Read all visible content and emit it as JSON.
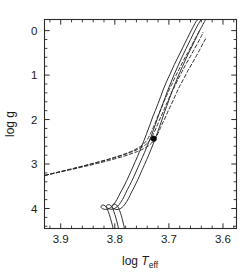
{
  "chart_data": {
    "type": "line",
    "title": "",
    "xlabel": "log T_eff",
    "ylabel": "log g",
    "xlabel_parts": {
      "prefix": "log ",
      "symbol": "T",
      "subscript": "eff"
    },
    "xlim": [
      3.93,
      3.575
    ],
    "ylim": [
      4.45,
      -0.25
    ],
    "x_inverted": true,
    "y_inverted": true,
    "grid": false,
    "legend": "none",
    "xticks": [
      3.9,
      3.8,
      3.7,
      3.6
    ],
    "xtick_labels": [
      "3.9",
      "3.8",
      "3.7",
      "3.6"
    ],
    "x_minor_ticks": [
      3.92,
      3.88,
      3.86,
      3.84,
      3.82,
      3.78,
      3.76,
      3.74,
      3.72,
      3.68,
      3.66,
      3.64,
      3.62,
      3.58
    ],
    "yticks": [
      0,
      1,
      2,
      3,
      4
    ],
    "ytick_labels": [
      "0",
      "1",
      "2",
      "3",
      "4"
    ],
    "y_minor_ticks": [
      0.2,
      0.4,
      0.6,
      0.8,
      1.2,
      1.4,
      1.6,
      1.8,
      2.2,
      2.4,
      2.6,
      2.8,
      3.2,
      3.4,
      3.6,
      3.8,
      4.2,
      4.4
    ],
    "series": [
      {
        "name": "isochrone-solid-1",
        "style": "solid",
        "color": "#262626",
        "points": [
          [
            3.782,
            4.47
          ],
          [
            3.783,
            4.4
          ],
          [
            3.785,
            4.3
          ],
          [
            3.787,
            4.2
          ],
          [
            3.789,
            4.12
          ],
          [
            3.791,
            4.05
          ],
          [
            3.793,
            3.99
          ],
          [
            3.795,
            3.95
          ],
          [
            3.797,
            3.92
          ],
          [
            3.799,
            3.905
          ],
          [
            3.801,
            3.9
          ],
          [
            3.803,
            3.905
          ],
          [
            3.804,
            3.915
          ],
          [
            3.805,
            3.935
          ],
          [
            3.805,
            3.96
          ],
          [
            3.804,
            3.985
          ],
          [
            3.802,
            4.005
          ],
          [
            3.799,
            4.02
          ],
          [
            3.796,
            4.025
          ],
          [
            3.793,
            4.02
          ],
          [
            3.79,
            4.005
          ],
          [
            3.787,
            3.98
          ],
          [
            3.784,
            3.945
          ],
          [
            3.781,
            3.9
          ],
          [
            3.778,
            3.845
          ],
          [
            3.775,
            3.78
          ],
          [
            3.772,
            3.71
          ],
          [
            3.769,
            3.63
          ],
          [
            3.765,
            3.54
          ],
          [
            3.761,
            3.44
          ],
          [
            3.757,
            3.34
          ],
          [
            3.753,
            3.23
          ],
          [
            3.749,
            3.12
          ],
          [
            3.745,
            3.01
          ],
          [
            3.741,
            2.9
          ],
          [
            3.737,
            2.79
          ],
          [
            3.733,
            2.67
          ],
          [
            3.729,
            2.55
          ],
          [
            3.725,
            2.42
          ],
          [
            3.721,
            2.29
          ],
          [
            3.717,
            2.15
          ],
          [
            3.713,
            2.01
          ],
          [
            3.709,
            1.86
          ],
          [
            3.704,
            1.7
          ],
          [
            3.699,
            1.53
          ],
          [
            3.694,
            1.36
          ],
          [
            3.688,
            1.18
          ],
          [
            3.682,
            1.0
          ],
          [
            3.675,
            0.81
          ],
          [
            3.668,
            0.62
          ],
          [
            3.66,
            0.42
          ],
          [
            3.652,
            0.22
          ],
          [
            3.644,
            0.02
          ],
          [
            3.637,
            -0.14
          ],
          [
            3.632,
            -0.25
          ]
        ]
      },
      {
        "name": "isochrone-solid-2",
        "style": "solid",
        "color": "#262626",
        "points": [
          [
            3.793,
            4.47
          ],
          [
            3.794,
            4.4
          ],
          [
            3.796,
            4.3
          ],
          [
            3.798,
            4.21
          ],
          [
            3.8,
            4.13
          ],
          [
            3.802,
            4.06
          ],
          [
            3.804,
            4.0
          ],
          [
            3.806,
            3.96
          ],
          [
            3.808,
            3.93
          ],
          [
            3.81,
            3.915
          ],
          [
            3.812,
            3.912
          ],
          [
            3.814,
            3.918
          ],
          [
            3.815,
            3.932
          ],
          [
            3.8155,
            3.952
          ],
          [
            3.815,
            3.975
          ],
          [
            3.813,
            3.996
          ],
          [
            3.81,
            4.01
          ],
          [
            3.807,
            4.017
          ],
          [
            3.804,
            4.014
          ],
          [
            3.801,
            4.002
          ],
          [
            3.798,
            3.982
          ],
          [
            3.795,
            3.952
          ],
          [
            3.792,
            3.912
          ],
          [
            3.789,
            3.862
          ],
          [
            3.786,
            3.802
          ],
          [
            3.783,
            3.735
          ],
          [
            3.78,
            3.66
          ],
          [
            3.777,
            3.58
          ],
          [
            3.773,
            3.49
          ],
          [
            3.769,
            3.39
          ],
          [
            3.765,
            3.29
          ],
          [
            3.761,
            3.18
          ],
          [
            3.757,
            3.07
          ],
          [
            3.753,
            2.96
          ],
          [
            3.749,
            2.85
          ],
          [
            3.745,
            2.74
          ],
          [
            3.741,
            2.62
          ],
          [
            3.737,
            2.5
          ],
          [
            3.733,
            2.38
          ],
          [
            3.729,
            2.25
          ],
          [
            3.725,
            2.11
          ],
          [
            3.721,
            1.97
          ],
          [
            3.717,
            1.83
          ],
          [
            3.712,
            1.67
          ],
          [
            3.707,
            1.51
          ],
          [
            3.702,
            1.34
          ],
          [
            3.696,
            1.16
          ],
          [
            3.69,
            0.98
          ],
          [
            3.683,
            0.79
          ],
          [
            3.676,
            0.6
          ],
          [
            3.668,
            0.4
          ],
          [
            3.66,
            0.2
          ],
          [
            3.652,
            0.0
          ],
          [
            3.645,
            -0.16
          ],
          [
            3.64,
            -0.25
          ]
        ]
      },
      {
        "name": "isochrone-solid-3",
        "style": "solid",
        "color": "#262626",
        "points": [
          [
            3.803,
            4.47
          ],
          [
            3.804,
            4.4
          ],
          [
            3.806,
            4.31
          ],
          [
            3.808,
            4.22
          ],
          [
            3.81,
            4.14
          ],
          [
            3.812,
            4.07
          ],
          [
            3.814,
            4.01
          ],
          [
            3.816,
            3.97
          ],
          [
            3.818,
            3.94
          ],
          [
            3.82,
            3.925
          ],
          [
            3.822,
            3.922
          ],
          [
            3.824,
            3.928
          ],
          [
            3.825,
            3.942
          ],
          [
            3.8255,
            3.962
          ],
          [
            3.825,
            3.984
          ],
          [
            3.823,
            4.003
          ],
          [
            3.82,
            4.016
          ],
          [
            3.817,
            4.021
          ],
          [
            3.814,
            4.017
          ],
          [
            3.811,
            4.004
          ],
          [
            3.808,
            3.982
          ],
          [
            3.805,
            3.951
          ],
          [
            3.802,
            3.91
          ],
          [
            3.799,
            3.858
          ],
          [
            3.796,
            3.796
          ],
          [
            3.793,
            3.727
          ],
          [
            3.79,
            3.651
          ],
          [
            3.786,
            3.565
          ],
          [
            3.782,
            3.472
          ],
          [
            3.778,
            3.372
          ],
          [
            3.774,
            3.268
          ],
          [
            3.77,
            3.16
          ],
          [
            3.766,
            3.05
          ],
          [
            3.762,
            2.94
          ],
          [
            3.758,
            2.828
          ],
          [
            3.754,
            2.712
          ],
          [
            3.75,
            2.592
          ],
          [
            3.746,
            2.47
          ],
          [
            3.742,
            2.344
          ],
          [
            3.738,
            2.214
          ],
          [
            3.734,
            2.08
          ],
          [
            3.73,
            1.942
          ],
          [
            3.725,
            1.795
          ],
          [
            3.72,
            1.64
          ],
          [
            3.715,
            1.478
          ],
          [
            3.71,
            1.312
          ],
          [
            3.704,
            1.138
          ],
          [
            3.697,
            0.955
          ],
          [
            3.69,
            0.765
          ],
          [
            3.682,
            0.57
          ],
          [
            3.674,
            0.372
          ],
          [
            3.666,
            0.175
          ],
          [
            3.658,
            -0.02
          ],
          [
            3.65,
            -0.2
          ],
          [
            3.646,
            -0.25
          ]
        ]
      },
      {
        "name": "horizontal-branch-dashed-1",
        "style": "dashed",
        "color": "#262626",
        "points": [
          [
            3.929,
            3.255
          ],
          [
            3.915,
            3.215
          ],
          [
            3.9,
            3.175
          ],
          [
            3.885,
            3.135
          ],
          [
            3.87,
            3.095
          ],
          [
            3.855,
            3.053
          ],
          [
            3.84,
            3.01
          ],
          [
            3.825,
            2.965
          ],
          [
            3.81,
            2.918
          ],
          [
            3.796,
            2.87
          ],
          [
            3.782,
            2.82
          ],
          [
            3.77,
            2.77
          ],
          [
            3.758,
            2.718
          ],
          [
            3.748,
            2.665
          ],
          [
            3.74,
            2.61
          ],
          [
            3.734,
            2.552
          ],
          [
            3.729,
            2.49
          ],
          [
            3.725,
            2.425
          ],
          [
            3.722,
            2.355
          ],
          [
            3.719,
            2.28
          ],
          [
            3.716,
            2.2
          ],
          [
            3.713,
            2.112
          ],
          [
            3.709,
            2.015
          ],
          [
            3.705,
            1.91
          ],
          [
            3.701,
            1.795
          ],
          [
            3.696,
            1.672
          ],
          [
            3.691,
            1.54
          ],
          [
            3.686,
            1.4
          ],
          [
            3.68,
            1.25
          ],
          [
            3.673,
            1.092
          ],
          [
            3.666,
            0.928
          ],
          [
            3.658,
            0.758
          ],
          [
            3.65,
            0.584
          ],
          [
            3.642,
            0.408
          ],
          [
            3.636,
            0.268
          ],
          [
            3.632,
            0.18
          ]
        ]
      },
      {
        "name": "horizontal-branch-dashed-2",
        "style": "dashed",
        "color": "#262626",
        "points": [
          [
            3.929,
            3.255
          ],
          [
            3.914,
            3.212
          ],
          [
            3.899,
            3.168
          ],
          [
            3.884,
            3.124
          ],
          [
            3.869,
            3.079
          ],
          [
            3.854,
            3.033
          ],
          [
            3.839,
            2.986
          ],
          [
            3.824,
            2.938
          ],
          [
            3.809,
            2.888
          ],
          [
            3.795,
            2.836
          ],
          [
            3.781,
            2.782
          ],
          [
            3.769,
            2.728
          ],
          [
            3.758,
            2.672
          ],
          [
            3.749,
            2.614
          ],
          [
            3.742,
            2.554
          ],
          [
            3.737,
            2.492
          ],
          [
            3.733,
            2.426
          ],
          [
            3.73,
            2.356
          ],
          [
            3.727,
            2.282
          ],
          [
            3.724,
            2.202
          ],
          [
            3.721,
            2.116
          ],
          [
            3.718,
            2.022
          ],
          [
            3.714,
            1.92
          ],
          [
            3.71,
            1.808
          ],
          [
            3.706,
            1.686
          ],
          [
            3.701,
            1.556
          ],
          [
            3.696,
            1.418
          ],
          [
            3.69,
            1.272
          ],
          [
            3.684,
            1.118
          ],
          [
            3.677,
            0.956
          ],
          [
            3.67,
            0.788
          ],
          [
            3.662,
            0.616
          ],
          [
            3.654,
            0.44
          ],
          [
            3.646,
            0.262
          ],
          [
            3.64,
            0.124
          ],
          [
            3.637,
            0.04
          ]
        ]
      },
      {
        "name": "horizontal-branch-dashed-3",
        "style": "dashed",
        "color": "#262626",
        "points": [
          [
            3.929,
            3.255
          ],
          [
            3.913,
            3.208
          ],
          [
            3.897,
            3.16
          ],
          [
            3.881,
            3.112
          ],
          [
            3.865,
            3.063
          ],
          [
            3.849,
            3.013
          ],
          [
            3.833,
            2.962
          ],
          [
            3.817,
            2.91
          ],
          [
            3.802,
            2.856
          ],
          [
            3.788,
            2.8
          ],
          [
            3.775,
            2.743
          ],
          [
            3.764,
            2.684
          ],
          [
            3.755,
            2.624
          ],
          [
            3.748,
            2.562
          ],
          [
            3.743,
            2.498
          ],
          [
            3.739,
            2.432
          ],
          [
            3.736,
            2.363
          ],
          [
            3.733,
            2.29
          ],
          [
            3.73,
            2.212
          ],
          [
            3.727,
            2.128
          ],
          [
            3.724,
            2.038
          ],
          [
            3.721,
            1.94
          ],
          [
            3.717,
            1.834
          ],
          [
            3.713,
            1.718
          ],
          [
            3.709,
            1.592
          ],
          [
            3.704,
            1.458
          ],
          [
            3.699,
            1.316
          ],
          [
            3.693,
            1.166
          ],
          [
            3.687,
            1.008
          ],
          [
            3.68,
            0.842
          ],
          [
            3.673,
            0.67
          ],
          [
            3.665,
            0.494
          ],
          [
            3.657,
            0.314
          ],
          [
            3.65,
            0.152
          ],
          [
            3.645,
            0.04
          ],
          [
            3.643,
            -0.02
          ]
        ]
      }
    ],
    "markers": [
      {
        "name": "observed-star",
        "x": 3.728,
        "y": 2.43,
        "shape": "filled-circle",
        "color": "#000000",
        "size": 5.5
      }
    ]
  }
}
